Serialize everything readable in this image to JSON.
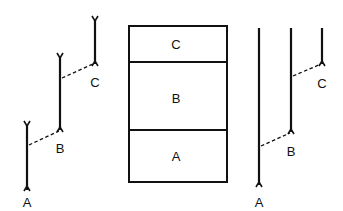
{
  "diagram": {
    "left_group": {
      "segments": [
        {
          "label": "A",
          "x": 27,
          "y_top": 125,
          "y_bottom": 190,
          "label_y": 206
        },
        {
          "label": "B",
          "x": 60,
          "y_top": 57,
          "y_bottom": 130,
          "label_y": 152
        },
        {
          "label": "C",
          "x": 95,
          "y_top": 20,
          "y_bottom": 64,
          "label_y": 86
        }
      ],
      "links": [
        {
          "from": "A",
          "x1": 29,
          "y1": 145,
          "x2": 60,
          "y2": 131
        },
        {
          "from": "B",
          "x1": 62,
          "y1": 78,
          "x2": 93,
          "y2": 64
        }
      ]
    },
    "column": {
      "x": 129,
      "y": 26,
      "width": 98,
      "height": 156,
      "sections": [
        {
          "label": "C",
          "y_top": 26,
          "y_bottom": 62
        },
        {
          "label": "B",
          "y_top": 62,
          "y_bottom": 130
        },
        {
          "label": "A",
          "y_top": 130,
          "y_bottom": 182
        }
      ]
    },
    "right_group": {
      "segments": [
        {
          "label": "A",
          "x": 259,
          "y_top": 28,
          "y_bottom": 185,
          "label_y": 205
        },
        {
          "label": "B",
          "x": 291,
          "y_top": 28,
          "y_bottom": 132,
          "label_y": 155
        },
        {
          "label": "C",
          "x": 322,
          "y_top": 28,
          "y_bottom": 64,
          "label_y": 87
        }
      ],
      "links": [
        {
          "from": "A",
          "x1": 260,
          "y1": 146,
          "x2": 290,
          "y2": 132
        },
        {
          "from": "B",
          "x1": 292,
          "y1": 76,
          "x2": 321,
          "y2": 64
        }
      ]
    },
    "labels": {
      "left_a": "A",
      "left_b": "B",
      "left_c": "C",
      "col_c": "C",
      "col_b": "B",
      "col_a": "A",
      "right_a": "A",
      "right_b": "B",
      "right_c": "C"
    },
    "colors": {
      "ink": "#111111",
      "background": "#ffffff"
    }
  }
}
